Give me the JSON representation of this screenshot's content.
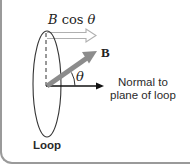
{
  "diagram": {
    "labels": {
      "component": {
        "prefix": "B",
        "func": " cos ",
        "angle": "θ"
      },
      "field": "B",
      "angle": "θ",
      "normal_line1": "Normal to",
      "normal_line2": "plane of loop",
      "loop": "Loop"
    },
    "elements": [
      {
        "id": "loop",
        "type": "ellipse",
        "description": "Wire loop seen edge-on",
        "stroke": "#333333"
      },
      {
        "id": "dashed-axis",
        "type": "dashed-line",
        "description": "Vertical dashed line in plane of loop",
        "stroke": "#333333"
      },
      {
        "id": "normal-arrow",
        "type": "arrow",
        "description": "Normal to plane of loop",
        "color": "#111111"
      },
      {
        "id": "field-arrow",
        "type": "thick-arrow",
        "description": "Magnetic field vector B at angle θ to the normal",
        "color": "#8c8c8c"
      },
      {
        "id": "component-arrow",
        "type": "hollow-arrow",
        "description": "Component B cos θ along the normal",
        "color": "#b0b0b0"
      },
      {
        "id": "angle-arc",
        "type": "arc",
        "description": "Angle θ between B and the normal",
        "stroke": "#333333"
      }
    ],
    "colors": {
      "frame_border": "#9a9a9a",
      "field_arrow": "#8c8c8c",
      "component_arrow_outline": "#b0b0b0",
      "ink": "#222222"
    }
  }
}
